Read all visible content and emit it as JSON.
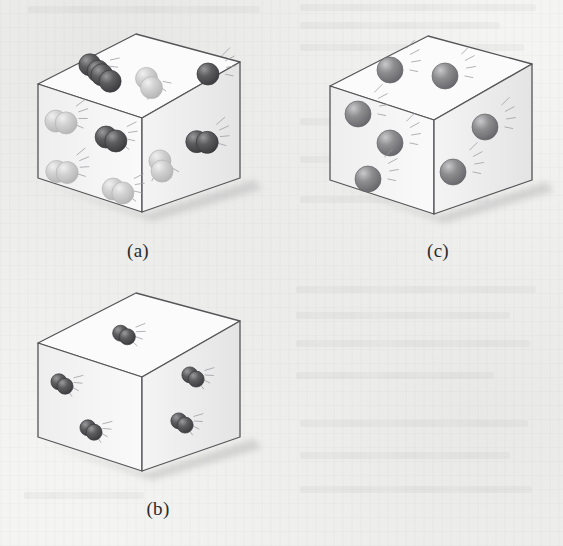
{
  "figure": {
    "background_color": "#f4f4f2",
    "panel_count": 3
  },
  "colors": {
    "cube_edge": "#565659",
    "cube_face_top": "#fbfbfb",
    "cube_face_left": "#f3f3f3",
    "cube_face_right": "#ededed",
    "shadow": "#b9b9ba",
    "atom_dark": "#5d5d60",
    "atom_dark_highlight": "#9a9a9d",
    "atom_light": "#d2d2d2",
    "atom_light_highlight": "#f0f0f0",
    "atom_medium": "#8e8e91",
    "atom_medium_highlight": "#c9c9cc",
    "motion_line": "#9a9aa0",
    "caption_text": "#2b2b2b"
  },
  "panels": [
    {
      "id": "a",
      "caption": "(a)",
      "caption_x": 78,
      "caption_y": 240,
      "origin_x": 18,
      "origin_y": 26,
      "description": "Cube containing a mixture of dark diatomic molecules and light-gray diatomic molecules",
      "cube": {
        "top_back": [
          118,
          8
        ],
        "top_left": [
          20,
          58
        ],
        "top_right": [
          222,
          36
        ],
        "top_front": [
          124,
          92
        ],
        "bottom_left": [
          20,
          152
        ],
        "bottom_front": [
          124,
          186
        ],
        "bottom_right": [
          222,
          152
        ]
      },
      "species": [
        {
          "name": "dark-diatomic",
          "color_key": "atom_dark",
          "count": 4
        },
        {
          "name": "light-diatomic",
          "color_key": "atom_light",
          "count": 6
        },
        {
          "name": "dark-single",
          "color_key": "atom_dark",
          "count": 1
        }
      ],
      "particles": [
        {
          "name": "dark-diatomic-top-1",
          "face": "top",
          "type": "diatomic",
          "shade": "dark",
          "x": 76,
          "y": 42,
          "r": 11,
          "angle": 38,
          "motion": true
        },
        {
          "name": "dark-diatomic-top-2",
          "face": "top",
          "type": "diatomic",
          "shade": "dark",
          "x": 88,
          "y": 52,
          "r": 11,
          "angle": 38,
          "motion": false
        },
        {
          "name": "light-diatomic-top-1",
          "face": "top",
          "type": "diatomic",
          "shade": "light",
          "x": 131,
          "y": 57,
          "r": 11,
          "angle": 62,
          "motion": true
        },
        {
          "name": "dark-single-top-1",
          "face": "top",
          "type": "single",
          "shade": "dark",
          "x": 190,
          "y": 48,
          "r": 11,
          "angle": 0,
          "motion": true
        },
        {
          "name": "light-diatomic-left-1",
          "face": "left",
          "type": "diatomic",
          "shade": "light",
          "x": 43,
          "y": 96,
          "r": 11,
          "angle": 10,
          "motion": true
        },
        {
          "name": "dark-diatomic-left-1",
          "face": "left",
          "type": "diatomic",
          "shade": "dark",
          "x": 93,
          "y": 113,
          "r": 11,
          "angle": 22,
          "motion": true
        },
        {
          "name": "light-diatomic-left-2",
          "face": "left",
          "type": "diatomic",
          "shade": "light",
          "x": 44,
          "y": 146,
          "r": 11,
          "angle": 6,
          "motion": true
        },
        {
          "name": "light-diatomic-left-3",
          "face": "left",
          "type": "diatomic",
          "shade": "light",
          "x": 100,
          "y": 165,
          "r": 11,
          "angle": 22,
          "motion": true
        },
        {
          "name": "dark-diatomic-right-1",
          "face": "right",
          "type": "diatomic",
          "shade": "dark",
          "x": 184,
          "y": 116,
          "r": 11,
          "angle": 4,
          "motion": true
        },
        {
          "name": "light-diatomic-right-1",
          "face": "right",
          "type": "diatomic",
          "shade": "light",
          "x": 143,
          "y": 140,
          "r": 11,
          "angle": 78,
          "motion": true
        }
      ]
    },
    {
      "id": "b",
      "caption": "(b)",
      "caption_x": 98,
      "caption_y": 498,
      "origin_x": 18,
      "origin_y": 285,
      "description": "Cube containing five small dark diatomic molecules only",
      "cube": {
        "top_back": [
          118,
          8
        ],
        "top_left": [
          20,
          58
        ],
        "top_right": [
          222,
          36
        ],
        "top_front": [
          124,
          92
        ],
        "bottom_left": [
          20,
          152
        ],
        "bottom_front": [
          124,
          186
        ],
        "bottom_right": [
          222,
          152
        ]
      },
      "species": [
        {
          "name": "dark-diatomic",
          "color_key": "atom_dark",
          "count": 5
        }
      ],
      "particles": [
        {
          "name": "dark-diatomic-top-1",
          "face": "top",
          "type": "diatomic",
          "shade": "dark",
          "x": 106,
          "y": 50,
          "r": 8,
          "angle": 28,
          "motion": true
        },
        {
          "name": "dark-diatomic-left-1",
          "face": "left",
          "type": "diatomic",
          "shade": "dark",
          "x": 44,
          "y": 99,
          "r": 8,
          "angle": 36,
          "motion": true
        },
        {
          "name": "dark-diatomic-left-2",
          "face": "left",
          "type": "diatomic",
          "shade": "dark",
          "x": 73,
          "y": 145,
          "r": 8,
          "angle": 36,
          "motion": true
        },
        {
          "name": "dark-diatomic-right-1",
          "face": "right",
          "type": "diatomic",
          "shade": "dark",
          "x": 175,
          "y": 92,
          "r": 8,
          "angle": 34,
          "motion": true
        },
        {
          "name": "dark-diatomic-right-2",
          "face": "right",
          "type": "diatomic",
          "shade": "dark",
          "x": 164,
          "y": 138,
          "r": 8,
          "angle": 34,
          "motion": true
        }
      ]
    },
    {
      "id": "c",
      "caption": "(c)",
      "caption_x": 378,
      "caption_y": 240,
      "origin_x": 310,
      "origin_y": 28,
      "description": "Cube containing seven single medium-gray atoms",
      "cube": {
        "top_back": [
          118,
          8
        ],
        "top_left": [
          20,
          58
        ],
        "top_right": [
          222,
          36
        ],
        "top_front": [
          124,
          92
        ],
        "bottom_left": [
          20,
          152
        ],
        "bottom_front": [
          124,
          186
        ],
        "bottom_right": [
          222,
          152
        ]
      },
      "species": [
        {
          "name": "medium-single-atom",
          "color_key": "atom_medium",
          "count": 7
        }
      ],
      "particles": [
        {
          "name": "atom-top-1",
          "face": "top",
          "type": "single",
          "shade": "medium",
          "x": 80,
          "y": 42,
          "r": 13,
          "angle": 0,
          "motion": true
        },
        {
          "name": "atom-top-2",
          "face": "top",
          "type": "single",
          "shade": "medium",
          "x": 135,
          "y": 48,
          "r": 13,
          "angle": 0,
          "motion": true
        },
        {
          "name": "atom-left-1",
          "face": "left",
          "type": "single",
          "shade": "medium",
          "x": 48,
          "y": 86,
          "r": 13,
          "angle": 0,
          "motion": true
        },
        {
          "name": "atom-left-2",
          "face": "left",
          "type": "single",
          "shade": "medium",
          "x": 80,
          "y": 115,
          "r": 13,
          "angle": 0,
          "motion": true
        },
        {
          "name": "atom-left-3",
          "face": "left",
          "type": "single",
          "shade": "medium",
          "x": 58,
          "y": 151,
          "r": 13,
          "angle": 0,
          "motion": true
        },
        {
          "name": "atom-right-1",
          "face": "right",
          "type": "single",
          "shade": "medium",
          "x": 175,
          "y": 99,
          "r": 13,
          "angle": 0,
          "motion": true
        },
        {
          "name": "atom-right-2",
          "face": "right",
          "type": "single",
          "shade": "medium",
          "x": 143,
          "y": 144,
          "r": 13,
          "angle": 0,
          "motion": true
        }
      ]
    }
  ]
}
